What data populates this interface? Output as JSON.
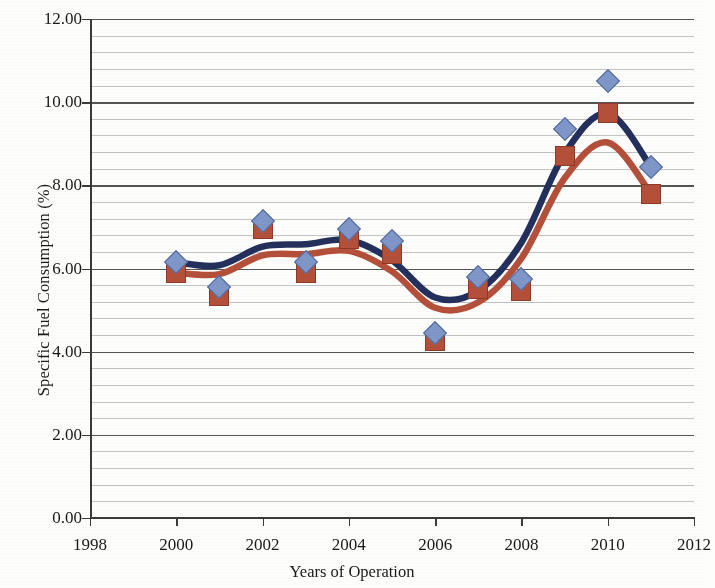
{
  "chart_data": {
    "type": "scatter",
    "title": "",
    "xlabel": "Years of Operation",
    "ylabel": "Specific Fuel Consumption (%)",
    "xlim": [
      1998,
      2012
    ],
    "ylim": [
      0.0,
      12.0
    ],
    "x_ticks": [
      "1998",
      "2000",
      "2002",
      "2004",
      "2006",
      "2008",
      "2010",
      "2012"
    ],
    "x_tick_values": [
      1998,
      2000,
      2002,
      2004,
      2006,
      2008,
      2010,
      2012
    ],
    "y_ticks": [
      "0.00",
      "2.00",
      "4.00",
      "6.00",
      "8.00",
      "10.00",
      "12.00"
    ],
    "y_tick_values": [
      0,
      2,
      4,
      6,
      8,
      10,
      12
    ],
    "y_minor_interval": 0.4,
    "grid": "horizontal-major-and-minor",
    "legend": "none",
    "x": [
      2000,
      2001,
      2002,
      2003,
      2004,
      2005,
      2006,
      2007,
      2008,
      2009,
      2010,
      2011
    ],
    "series": [
      {
        "name": "Series 1",
        "marker": "diamond",
        "color": "#7f96c8",
        "trendline_color": "#24305c",
        "values": [
          6.15,
          5.55,
          7.15,
          6.15,
          6.95,
          6.65,
          4.45,
          5.8,
          5.75,
          9.35,
          10.5,
          8.45
        ]
      },
      {
        "name": "Series 2",
        "marker": "square",
        "color": "#b4503a",
        "trendline_color": "#b4503a",
        "values": [
          5.9,
          5.35,
          6.95,
          5.9,
          6.7,
          6.35,
          4.25,
          5.5,
          5.45,
          8.7,
          9.75,
          7.8
        ]
      }
    ],
    "colors": {
      "series1_marker": "#7f96c8",
      "series1_trend": "#24305c",
      "series2_marker": "#b4503a",
      "series2_trend": "#b4503a",
      "major_gridline": "#555555",
      "minor_gridline": "#c3c3c6",
      "axis": "#3a3a3a",
      "background": "#fdfdfb"
    }
  }
}
